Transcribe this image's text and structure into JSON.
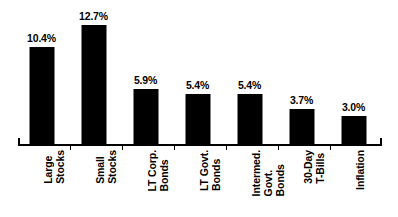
{
  "chart_data": {
    "type": "bar",
    "title": "",
    "subtitle": "",
    "xlabel": "",
    "ylabel": "",
    "grid": false,
    "legend": "none",
    "ylim": [
      0,
      13.5
    ],
    "categories": [
      "Large Stocks",
      "Small Stocks",
      "LT Corp. Bonds",
      "LT Govt. Bonds",
      "Intermed. Govt. Bonds",
      "30-Day T-Bills",
      "Inflation"
    ],
    "category_lines": [
      [
        "Large",
        "Stocks"
      ],
      [
        "Small",
        "Stocks"
      ],
      [
        "LT Corp.",
        "Bonds"
      ],
      [
        "LT Govt.",
        "Bonds"
      ],
      [
        "Intermed.",
        "Govt.",
        "Bonds"
      ],
      [
        "30-Day",
        "T-Bills"
      ],
      [
        "Inflation"
      ]
    ],
    "values": [
      10.4,
      12.7,
      5.9,
      5.4,
      5.4,
      3.7,
      3.0
    ],
    "value_labels": [
      "10.4%",
      "12.7%",
      "5.9%",
      "5.4%",
      "5.4%",
      "3.7%",
      "3.0%"
    ],
    "bar_color": "#000000",
    "background_color": "#ffffff",
    "axis_color": "#000000"
  }
}
